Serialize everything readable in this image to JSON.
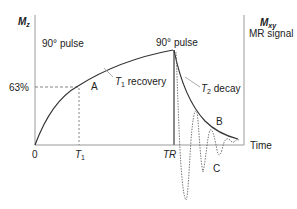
{
  "diagram": {
    "left_axis": {
      "label_main": "M",
      "label_sub": "z"
    },
    "right_axis": {
      "label_main": "M",
      "label_sub": "xy",
      "caption": "MR signal"
    },
    "x_axis": {
      "origin_label": "0",
      "t1_label_main": "T",
      "t1_label_sub": "1",
      "tr_label": "TR",
      "end_label": "Time"
    },
    "y_marker": {
      "label": "63%"
    },
    "annotations": {
      "pulse_left": "90° pulse",
      "pulse_right": "90° pulse",
      "t1_recovery_main": "T",
      "t1_recovery_sub": "1",
      "t1_recovery_rest": " recovery",
      "t2_decay_main": "T",
      "t2_decay_sub": "2",
      "t2_decay_rest": " decay",
      "point_a": "A",
      "point_b": "B",
      "point_c": "C"
    },
    "colors": {
      "curve": "#333333",
      "axis": "#9a9a9a",
      "dashed": "#666666",
      "tr_line": "#888888",
      "text": "#222222"
    }
  }
}
